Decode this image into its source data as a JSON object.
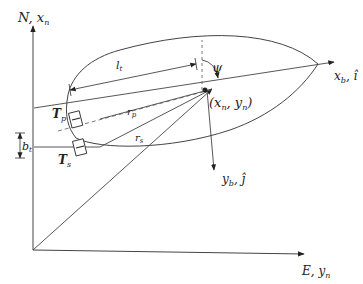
{
  "diagram": {
    "type": "vessel-kinematics",
    "axes": {
      "north": {
        "label": "N",
        "sub_label": "x",
        "sub_index": "n"
      },
      "east": {
        "label": "E",
        "sub_label": "y",
        "sub_index": "n"
      }
    },
    "body_axes": {
      "xb": {
        "label": "x",
        "index": "b",
        "unit": "î"
      },
      "yb": {
        "label": "y",
        "index": "b",
        "unit": "ĵ"
      }
    },
    "heading": {
      "symbol": "ψ"
    },
    "position": {
      "text": "(x",
      "n": "n",
      "comma": ", y",
      "close": ")"
    },
    "vectors": {
      "rp": {
        "label": "r",
        "index": "p"
      },
      "rs": {
        "label": "r",
        "index": "s"
      }
    },
    "thrusters": {
      "port": {
        "label": "T",
        "index": "p"
      },
      "starboard": {
        "label": "T",
        "index": "s"
      }
    },
    "dimensions": {
      "lt": {
        "label": "l",
        "index": "t"
      },
      "bt": {
        "label": "b",
        "index": "t"
      }
    },
    "colors": {
      "line": "#333333",
      "text": "#222222",
      "background": "#ffffff"
    }
  }
}
